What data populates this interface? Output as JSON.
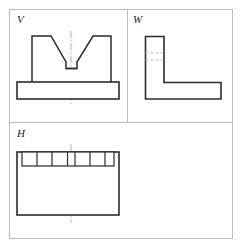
{
  "drawing": {
    "title": "Three-view orthographic projection of a V-block",
    "type": "engineering-drawing",
    "background_color": "#ffffff",
    "frame_color": "#b9b9b9",
    "outline_color": "#1a1a1a",
    "centerline_color": "#d08a8a",
    "hidden_line_color": "#c9b7b7",
    "frame": {
      "x": 9,
      "y": 9,
      "width": 224,
      "height": 230,
      "vertical_divider_x": 127,
      "vertical_divider_from_y": 9,
      "vertical_divider_to_y": 122,
      "horizontal_divider_y": 122,
      "horizontal_divider_from_x": 9,
      "horizontal_divider_to_x": 233
    },
    "panels": [
      {
        "key": "V",
        "label": "V",
        "name": "front-view",
        "description": "Front view: V-block with base plate and V-shaped notch with flat bottom"
      },
      {
        "key": "W",
        "label": "W",
        "name": "side-view",
        "description": "Side view: L-shaped profile with two hidden lines in the vertical leg"
      },
      {
        "key": "H",
        "label": "H",
        "name": "top-view",
        "description": "Top view: rectangle with a subdivided band of cells along the top edge"
      }
    ],
    "geometry": {
      "front_view": {
        "base_plate": {
          "x": 17,
          "y": 82,
          "width": 102,
          "height": 17
        },
        "upright_outline_points": "32,82 32,36 48,36 48,36",
        "profile_points": "32,82 32,36 51,36 66,62 66,68 77,68 77,62 93,36 111,36 111,82",
        "notch_flat_bottom": {
          "from_x": 66,
          "to_x": 77,
          "y": 68
        },
        "centerline_x": 71,
        "centerline_from_y": 31,
        "centerline_to_y": 105
      },
      "side_view": {
        "vertical_leg": {
          "x": 145,
          "y": 36,
          "width": 19,
          "height": 46
        },
        "horizontal_leg": {
          "x": 145,
          "y": 82,
          "width": 76,
          "height": 17
        },
        "hidden_lines": [
          {
            "from_x": 145,
            "to_x": 164,
            "y": 53
          },
          {
            "from_x": 145,
            "to_x": 164,
            "y": 60
          }
        ]
      },
      "top_view": {
        "outer_rect": {
          "x": 17,
          "y": 152,
          "width": 102,
          "height": 63
        },
        "cell_band": {
          "x": 22,
          "y": 152,
          "width": 92,
          "height": 14
        },
        "cell_dividers_x": [
          37,
          52,
          68,
          75,
          90,
          105
        ],
        "centerline_x": 71,
        "centerline_from_y": 144,
        "centerline_to_y": 223
      }
    }
  }
}
